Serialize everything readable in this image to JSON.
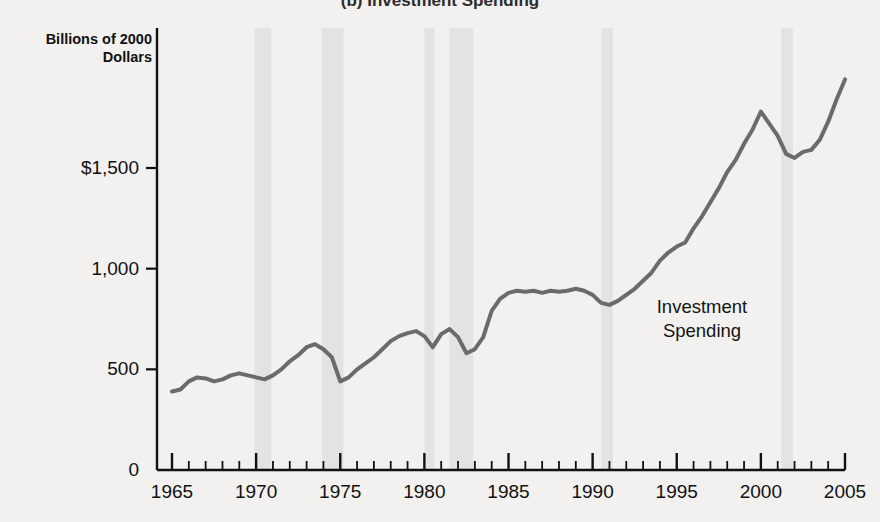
{
  "figure": {
    "title": "(b) Investment Spending",
    "background_color": "#f2f1ef"
  },
  "axis_title": "Billions of\n2000 Dollars",
  "annotation": {
    "text": "Investment\nSpending",
    "x_year": 1996.5,
    "y_value": 760
  },
  "chart_data": {
    "type": "line",
    "title": "(b) Investment Spending",
    "xlabel": "",
    "ylabel": "Billions of 2000 Dollars",
    "xlim": [
      1965,
      2005
    ],
    "ylim": [
      0,
      2000
    ],
    "grid": false,
    "legend": "none",
    "line_color": "#6b6b6b",
    "line_width": 4,
    "recession_band_color": "#e3e3e3",
    "y_ticks": [
      0,
      500,
      1000,
      1500
    ],
    "y_tick_labels": [
      "0",
      "500",
      "1,000",
      "$1,500"
    ],
    "x_major_ticks": [
      1965,
      1970,
      1975,
      1980,
      1985,
      1990,
      1995,
      2000,
      2005
    ],
    "x_major_tick_labels": [
      "1965",
      "1970",
      "1975",
      "1980",
      "1985",
      "1990",
      "1995",
      "2000",
      "2005"
    ],
    "x_minor_tick_step": 1,
    "recessions": [
      {
        "start": 1969.9,
        "end": 1970.9
      },
      {
        "start": 1973.9,
        "end": 1975.2
      },
      {
        "start": 1980.0,
        "end": 1980.6
      },
      {
        "start": 1981.5,
        "end": 1982.9
      },
      {
        "start": 1990.5,
        "end": 1991.2
      },
      {
        "start": 2001.2,
        "end": 2001.9
      }
    ],
    "series": [
      {
        "name": "Investment Spending",
        "x": [
          1965.0,
          1965.5,
          1966.0,
          1966.5,
          1967.0,
          1967.5,
          1968.0,
          1968.5,
          1969.0,
          1969.5,
          1970.0,
          1970.5,
          1971.0,
          1971.5,
          1972.0,
          1972.5,
          1973.0,
          1973.5,
          1974.0,
          1974.5,
          1975.0,
          1975.5,
          1976.0,
          1976.5,
          1977.0,
          1977.5,
          1978.0,
          1978.5,
          1979.0,
          1979.5,
          1980.0,
          1980.5,
          1981.0,
          1981.5,
          1982.0,
          1982.5,
          1983.0,
          1983.5,
          1984.0,
          1984.5,
          1985.0,
          1985.5,
          1986.0,
          1986.5,
          1987.0,
          1987.5,
          1988.0,
          1988.5,
          1989.0,
          1989.5,
          1990.0,
          1990.5,
          1991.0,
          1991.5,
          1992.0,
          1992.5,
          1993.0,
          1993.5,
          1994.0,
          1994.5,
          1995.0,
          1995.5,
          1996.0,
          1996.5,
          1997.0,
          1997.5,
          1998.0,
          1998.5,
          1999.0,
          1999.5,
          2000.0,
          2000.5,
          2001.0,
          2001.5,
          2002.0,
          2002.5,
          2003.0,
          2003.5,
          2004.0,
          2004.5,
          2005.0
        ],
        "y": [
          390,
          400,
          440,
          460,
          455,
          440,
          450,
          470,
          480,
          470,
          460,
          450,
          470,
          500,
          540,
          570,
          610,
          625,
          600,
          560,
          440,
          460,
          500,
          530,
          560,
          600,
          640,
          665,
          680,
          690,
          665,
          610,
          675,
          700,
          660,
          580,
          600,
          660,
          790,
          850,
          880,
          890,
          885,
          890,
          880,
          890,
          885,
          890,
          900,
          890,
          870,
          830,
          820,
          840,
          870,
          900,
          940,
          980,
          1040,
          1080,
          1110,
          1130,
          1200,
          1260,
          1330,
          1400,
          1480,
          1540,
          1620,
          1690,
          1780,
          1720,
          1660,
          1570,
          1550,
          1580,
          1590,
          1640,
          1730,
          1840,
          1940
        ]
      }
    ]
  }
}
